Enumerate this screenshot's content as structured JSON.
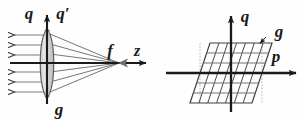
{
  "figure": {
    "background_color": "#fefefe",
    "ink_color": "#1a1a1a",
    "ray_color": "#6e6e6e",
    "lens_fill_color": "#d9d9d9",
    "grid_color": "#4a4a4a",
    "grid_light_color": "#8c8c8c",
    "dotted_color": "#9a9a9a"
  },
  "left_panel": {
    "name": "lens-ray-diagram",
    "labels": {
      "q": "q",
      "q_prime": "q′",
      "f": "f",
      "z": "z",
      "g": "g"
    },
    "ray_count": 6,
    "ray_y_positions": [
      35,
      45,
      55,
      72,
      82,
      92
    ],
    "axis_y": 63,
    "lens_x": 47,
    "focus_x": 119
  },
  "right_panel": {
    "name": "phase-space-grid",
    "labels": {
      "q": "q",
      "p": "p",
      "g": "g"
    },
    "axis_x": 231,
    "axis_y": 73,
    "shear": 0.32,
    "columns": 7,
    "rows": 6
  }
}
